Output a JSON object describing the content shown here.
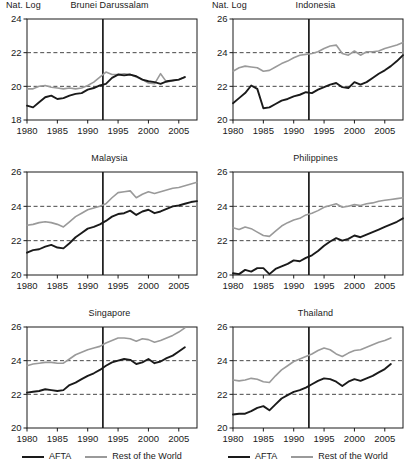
{
  "figure": {
    "axis_label": "Nat. Log",
    "legend": {
      "afta_label": "AFTA",
      "row_label": "Rest of the World",
      "afta_color": "#1a1a1a",
      "row_color": "#9a9a9a"
    },
    "colors": {
      "afta": "#1a1a1a",
      "rest_of_world": "#9a9a9a",
      "axis": "#1a1a1a",
      "gridline": "#333333",
      "event_line": "#1a1a1a",
      "background": "#ffffff"
    },
    "event_year": 1992.5,
    "xticks": [
      1980,
      1985,
      1990,
      1995,
      2000,
      2005
    ],
    "xlim": [
      1980,
      2008
    ]
  },
  "chart_data": [
    {
      "type": "line",
      "title": "Brunei Darussalam",
      "xlabel": "",
      "ylabel": "Nat. Log",
      "xlim": [
        1980,
        2008
      ],
      "ylim": [
        18,
        24
      ],
      "yticks": [
        18,
        20,
        22,
        24
      ],
      "gridlines": [
        20,
        22
      ],
      "grid": true,
      "legend_position": "below-figure",
      "event_line_year": 1992.5,
      "x": [
        1980,
        1981,
        1982,
        1983,
        1984,
        1985,
        1986,
        1987,
        1988,
        1989,
        1990,
        1991,
        1992,
        1993,
        1994,
        1995,
        1996,
        1997,
        1998,
        1999,
        2000,
        2001,
        2002,
        2003,
        2004,
        2005,
        2006
      ],
      "series": [
        {
          "name": "AFTA",
          "values": [
            18.85,
            18.75,
            19.05,
            19.35,
            19.45,
            19.25,
            19.3,
            19.45,
            19.55,
            19.6,
            19.8,
            19.9,
            20.05,
            20.15,
            20.5,
            20.7,
            20.65,
            20.7,
            20.6,
            20.4,
            20.3,
            20.25,
            20.15,
            20.3,
            20.35,
            20.4,
            20.55
          ]
        },
        {
          "name": "Rest of the World",
          "values": [
            19.85,
            19.85,
            20.0,
            20.05,
            19.95,
            19.9,
            19.85,
            19.9,
            19.85,
            19.9,
            20.05,
            20.25,
            20.55,
            20.85,
            20.7,
            20.7,
            20.75,
            20.7,
            20.55,
            20.4,
            20.2,
            20.15,
            20.75,
            20.25,
            20.35,
            20.4,
            20.55
          ]
        }
      ]
    },
    {
      "type": "line",
      "title": "Indonesia",
      "xlabel": "",
      "ylabel": "Nat. Log",
      "xlim": [
        1980,
        2008
      ],
      "ylim": [
        20,
        26
      ],
      "yticks": [
        20,
        22,
        24,
        26
      ],
      "gridlines": [
        22,
        24
      ],
      "grid": true,
      "legend_position": "below-figure",
      "event_line_year": 1992.5,
      "x": [
        1980,
        1981,
        1982,
        1983,
        1984,
        1985,
        1986,
        1987,
        1988,
        1989,
        1990,
        1991,
        1992,
        1993,
        1994,
        1995,
        1996,
        1997,
        1998,
        1999,
        2000,
        2001,
        2002,
        2003,
        2004,
        2005,
        2006,
        2007,
        2008
      ],
      "series": [
        {
          "name": "AFTA",
          "values": [
            21.0,
            21.3,
            21.6,
            22.05,
            21.85,
            20.7,
            20.75,
            20.95,
            21.15,
            21.25,
            21.4,
            21.5,
            21.65,
            21.6,
            21.8,
            21.95,
            22.1,
            22.2,
            21.95,
            21.9,
            22.25,
            22.1,
            22.25,
            22.5,
            22.75,
            22.95,
            23.2,
            23.5,
            23.85
          ]
        },
        {
          "name": "Rest of the World",
          "values": [
            22.9,
            23.1,
            23.2,
            23.15,
            23.1,
            22.9,
            22.95,
            23.15,
            23.35,
            23.5,
            23.7,
            23.85,
            23.9,
            23.95,
            24.05,
            24.25,
            24.4,
            24.45,
            23.95,
            23.85,
            24.1,
            23.85,
            24.05,
            24.05,
            24.1,
            24.25,
            24.35,
            24.45,
            24.6
          ]
        }
      ]
    },
    {
      "type": "line",
      "title": "Malaysia",
      "xlabel": "",
      "ylabel": "",
      "xlim": [
        1980,
        2008
      ],
      "ylim": [
        20,
        26
      ],
      "yticks": [
        20,
        22,
        24,
        26
      ],
      "gridlines": [
        22,
        24
      ],
      "grid": true,
      "legend_position": "below-figure",
      "event_line_year": 1992.5,
      "x": [
        1980,
        1981,
        1982,
        1983,
        1984,
        1985,
        1986,
        1987,
        1988,
        1989,
        1990,
        1991,
        1992,
        1993,
        1994,
        1995,
        1996,
        1997,
        1998,
        1999,
        2000,
        2001,
        2002,
        2003,
        2004,
        2005,
        2006,
        2007,
        2008
      ],
      "series": [
        {
          "name": "AFTA",
          "values": [
            21.3,
            21.45,
            21.5,
            21.65,
            21.75,
            21.6,
            21.55,
            21.85,
            22.2,
            22.45,
            22.7,
            22.8,
            22.95,
            23.15,
            23.4,
            23.55,
            23.6,
            23.75,
            23.5,
            23.7,
            23.8,
            23.6,
            23.7,
            23.85,
            24.0,
            24.05,
            24.15,
            24.25,
            24.3
          ]
        },
        {
          "name": "Rest of the World",
          "values": [
            22.9,
            22.95,
            23.05,
            23.1,
            23.05,
            22.95,
            22.8,
            23.1,
            23.4,
            23.6,
            23.8,
            23.9,
            24.0,
            24.15,
            24.5,
            24.8,
            24.85,
            24.9,
            24.5,
            24.7,
            24.85,
            24.75,
            24.85,
            24.95,
            25.05,
            25.1,
            25.2,
            25.3,
            25.4
          ]
        }
      ]
    },
    {
      "type": "line",
      "title": "Philippines",
      "xlabel": "",
      "ylabel": "",
      "xlim": [
        1980,
        2008
      ],
      "ylim": [
        20,
        26
      ],
      "yticks": [
        20,
        22,
        24,
        26
      ],
      "gridlines": [
        22,
        24
      ],
      "grid": true,
      "legend_position": "below-figure",
      "event_line_year": 1992.5,
      "x": [
        1980,
        1981,
        1982,
        1983,
        1984,
        1985,
        1986,
        1987,
        1988,
        1989,
        1990,
        1991,
        1992,
        1993,
        1994,
        1995,
        1996,
        1997,
        1998,
        1999,
        2000,
        2001,
        2002,
        2003,
        2004,
        2005,
        2006,
        2007,
        2008
      ],
      "series": [
        {
          "name": "AFTA",
          "values": [
            20.1,
            20.05,
            20.3,
            20.2,
            20.4,
            20.4,
            20.05,
            20.35,
            20.5,
            20.65,
            20.85,
            20.8,
            21.0,
            21.15,
            21.4,
            21.7,
            21.95,
            22.15,
            22.0,
            22.1,
            22.3,
            22.2,
            22.35,
            22.5,
            22.65,
            22.8,
            22.95,
            23.1,
            23.3
          ]
        },
        {
          "name": "Rest of the World",
          "values": [
            22.75,
            22.65,
            22.8,
            22.7,
            22.5,
            22.3,
            22.25,
            22.55,
            22.85,
            23.05,
            23.2,
            23.3,
            23.5,
            23.6,
            23.75,
            23.95,
            24.05,
            24.15,
            23.95,
            24.0,
            24.1,
            24.05,
            24.15,
            24.2,
            24.3,
            24.35,
            24.4,
            24.45,
            24.5
          ]
        }
      ]
    },
    {
      "type": "line",
      "title": "Singapore",
      "xlabel": "",
      "ylabel": "",
      "xlim": [
        1980,
        2008
      ],
      "ylim": [
        20,
        26
      ],
      "yticks": [
        20,
        22,
        24,
        26
      ],
      "gridlines": [
        22,
        24
      ],
      "grid": true,
      "legend_position": "below-panel",
      "event_line_year": 1992.5,
      "x": [
        1980,
        1981,
        1982,
        1983,
        1984,
        1985,
        1986,
        1987,
        1988,
        1989,
        1990,
        1991,
        1992,
        1993,
        1994,
        1995,
        1996,
        1997,
        1998,
        1999,
        2000,
        2001,
        2002,
        2003,
        2004,
        2005,
        2006
      ],
      "series": [
        {
          "name": "AFTA",
          "values": [
            22.1,
            22.15,
            22.2,
            22.3,
            22.25,
            22.2,
            22.25,
            22.55,
            22.7,
            22.9,
            23.1,
            23.25,
            23.45,
            23.7,
            23.9,
            24.0,
            24.1,
            24.05,
            23.8,
            23.9,
            24.1,
            23.85,
            23.95,
            24.15,
            24.3,
            24.55,
            24.8
          ]
        },
        {
          "name": "Rest of the World",
          "values": [
            23.7,
            23.8,
            23.85,
            23.9,
            23.9,
            23.85,
            23.85,
            24.1,
            24.35,
            24.5,
            24.65,
            24.75,
            24.85,
            25.05,
            25.2,
            25.35,
            25.35,
            25.3,
            25.15,
            25.3,
            25.25,
            25.1,
            25.2,
            25.35,
            25.5,
            25.7,
            25.95
          ]
        }
      ]
    },
    {
      "type": "line",
      "title": "Thailand",
      "xlabel": "",
      "ylabel": "",
      "xlim": [
        1980,
        2008
      ],
      "ylim": [
        20,
        26
      ],
      "yticks": [
        20,
        22,
        24,
        26
      ],
      "gridlines": [
        22,
        24
      ],
      "grid": true,
      "legend_position": "below-panel",
      "event_line_year": 1992.5,
      "x": [
        1980,
        1981,
        1982,
        1983,
        1984,
        1985,
        1986,
        1987,
        1988,
        1989,
        1990,
        1991,
        1992,
        1993,
        1994,
        1995,
        1996,
        1997,
        1998,
        1999,
        2000,
        2001,
        2002,
        2003,
        2004,
        2005,
        2006
      ],
      "series": [
        {
          "name": "AFTA",
          "values": [
            20.8,
            20.85,
            20.85,
            21.0,
            21.2,
            21.3,
            21.05,
            21.4,
            21.75,
            21.95,
            22.15,
            22.25,
            22.4,
            22.6,
            22.8,
            22.95,
            22.9,
            22.75,
            22.5,
            22.75,
            22.9,
            22.8,
            22.95,
            23.1,
            23.3,
            23.5,
            23.8
          ]
        },
        {
          "name": "Rest of the World",
          "values": [
            22.85,
            22.8,
            22.85,
            22.95,
            22.9,
            22.75,
            22.7,
            23.1,
            23.45,
            23.7,
            23.95,
            24.1,
            24.25,
            24.4,
            24.6,
            24.75,
            24.65,
            24.4,
            24.25,
            24.45,
            24.6,
            24.65,
            24.8,
            24.95,
            25.1,
            25.2,
            25.35
          ]
        }
      ]
    }
  ]
}
